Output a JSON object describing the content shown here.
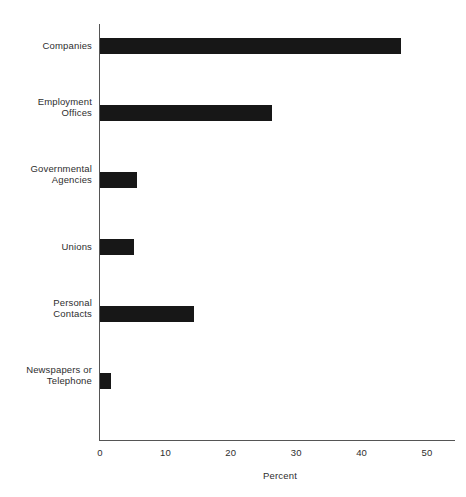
{
  "chart_data": {
    "type": "bar",
    "orientation": "horizontal",
    "title": "",
    "xlabel": "Percent",
    "ylabel": "",
    "categories": [
      "Companies",
      "Employment\nOffices",
      "Governmental\nAgencies",
      "Unions",
      "Personal\nContacts",
      "Newspapers or\nTelephone"
    ],
    "values": [
      46.0,
      26.3,
      5.7,
      5.2,
      14.4,
      1.7
    ],
    "xlim": [
      0,
      50
    ],
    "xticks": [
      0,
      10,
      20,
      30,
      40,
      50
    ],
    "xtick_labels": [
      "0",
      "10",
      "20",
      "30",
      "40",
      "50"
    ],
    "grid": false,
    "legend": false,
    "bar_color": "#171717",
    "axis_color": "#555555",
    "background": "#ffffff"
  },
  "figure": {
    "caption": ""
  }
}
